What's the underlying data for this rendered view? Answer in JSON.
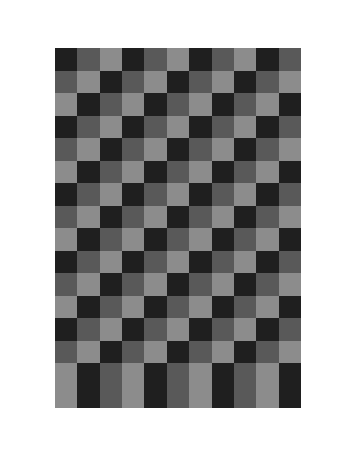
{
  "graphic": {
    "title": "Three-tone checkerboard panel with bordered frame",
    "background_color": "#ffffff",
    "palette": {
      "dark": "#1f1f1f",
      "medium": "#595959",
      "light": "#8c8c8c",
      "frame_gray": "#595959",
      "frame_black": "#1a1a1a"
    },
    "frame": {
      "bars": [
        {
          "name": "top-outer-bar",
          "color": "#595959",
          "orientation": "horizontal"
        },
        {
          "name": "top-inner-bar",
          "color": "#1a1a1a",
          "orientation": "horizontal"
        },
        {
          "name": "bottom-inner-bar",
          "color": "#1a1a1a",
          "orientation": "horizontal"
        },
        {
          "name": "bottom-outer-bar",
          "color": "#595959",
          "orientation": "horizontal"
        },
        {
          "name": "left-outer-bar",
          "color": "#595959",
          "orientation": "vertical"
        },
        {
          "name": "left-inner-bar",
          "color": "#1a1a1a",
          "orientation": "vertical"
        },
        {
          "name": "right-inner-bar",
          "color": "#1a1a1a",
          "orientation": "vertical"
        },
        {
          "name": "right-outer-bar",
          "color": "#595959",
          "orientation": "vertical"
        }
      ]
    },
    "grid": {
      "columns": 11,
      "rows": 16,
      "cell_size_px": 22.4,
      "tone_codes": [
        "d",
        "m",
        "l"
      ],
      "cells": [
        [
          "d",
          "m",
          "l",
          "d",
          "m",
          "l",
          "d",
          "m",
          "l",
          "d",
          "m"
        ],
        [
          "m",
          "l",
          "d",
          "m",
          "l",
          "d",
          "m",
          "l",
          "d",
          "m",
          "l"
        ],
        [
          "l",
          "d",
          "m",
          "l",
          "d",
          "m",
          "l",
          "d",
          "m",
          "l",
          "d"
        ],
        [
          "d",
          "m",
          "l",
          "d",
          "m",
          "l",
          "d",
          "m",
          "l",
          "d",
          "m"
        ],
        [
          "m",
          "l",
          "d",
          "m",
          "l",
          "d",
          "m",
          "l",
          "d",
          "m",
          "l"
        ],
        [
          "l",
          "d",
          "m",
          "l",
          "d",
          "m",
          "l",
          "d",
          "m",
          "l",
          "d"
        ],
        [
          "d",
          "m",
          "l",
          "d",
          "m",
          "l",
          "d",
          "m",
          "l",
          "d",
          "m"
        ],
        [
          "m",
          "l",
          "d",
          "m",
          "l",
          "d",
          "m",
          "l",
          "d",
          "m",
          "l"
        ],
        [
          "l",
          "d",
          "m",
          "l",
          "d",
          "m",
          "l",
          "d",
          "m",
          "l",
          "d"
        ],
        [
          "d",
          "m",
          "l",
          "d",
          "m",
          "l",
          "d",
          "m",
          "l",
          "d",
          "m"
        ],
        [
          "m",
          "l",
          "d",
          "m",
          "l",
          "d",
          "m",
          "l",
          "d",
          "m",
          "l"
        ],
        [
          "l",
          "d",
          "m",
          "l",
          "d",
          "m",
          "l",
          "d",
          "m",
          "l",
          "d"
        ],
        [
          "d",
          "m",
          "l",
          "d",
          "m",
          "l",
          "d",
          "m",
          "l",
          "d",
          "m"
        ],
        [
          "m",
          "l",
          "d",
          "m",
          "l",
          "d",
          "m",
          "l",
          "d",
          "m",
          "l"
        ],
        [
          "l",
          "d",
          "m",
          "l",
          "d",
          "m",
          "l",
          "d",
          "m",
          "l",
          "d"
        ],
        [
          "l",
          "d",
          "m",
          "l",
          "d",
          "m",
          "l",
          "d",
          "m",
          "l",
          "d"
        ]
      ]
    }
  }
}
